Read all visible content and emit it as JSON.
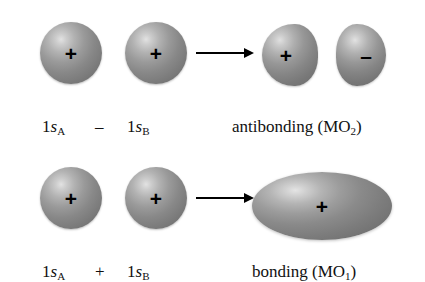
{
  "figure": {
    "background_color": "#ffffff",
    "orbital_fill_color": "#8a8a8a",
    "highlight_color": "#e2e2e2",
    "text_color": "#111111",
    "arrow_color": "#000000"
  },
  "rows": {
    "antibonding": {
      "name": "antibonding-row",
      "operator": "–",
      "arrow": "→",
      "left_orbital": {
        "label_prefix": "1",
        "label_italic": "s",
        "label_subscript": "A",
        "sign": "+",
        "shape": "sphere"
      },
      "right_orbital": {
        "label_prefix": "1",
        "label_italic": "s",
        "label_subscript": "B",
        "sign": "+",
        "shape": "sphere"
      },
      "result": {
        "label_text": "antibonding (MO",
        "label_subscript": "2",
        "label_suffix": ")",
        "left_lobe_sign": "+",
        "right_lobe_sign": "–",
        "shape": "two-lobes"
      }
    },
    "bonding": {
      "name": "bonding-row",
      "operator": "+",
      "arrow": "→",
      "left_orbital": {
        "label_prefix": "1",
        "label_italic": "s",
        "label_subscript": "A",
        "sign": "+",
        "shape": "sphere"
      },
      "right_orbital": {
        "label_prefix": "1",
        "label_italic": "s",
        "label_subscript": "B",
        "sign": "+",
        "shape": "sphere"
      },
      "result": {
        "label_text": "bonding (MO",
        "label_subscript": "1",
        "label_suffix": ")",
        "sign": "+",
        "shape": "ellipse"
      }
    }
  }
}
